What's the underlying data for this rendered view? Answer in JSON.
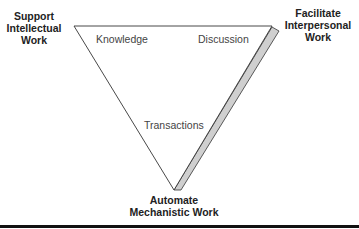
{
  "diagram": {
    "vertices": {
      "top_left": [
        "Support",
        "Intellectual",
        "Work"
      ],
      "top_right": [
        "Facilitate",
        "Interpersonal",
        "Work"
      ],
      "bottom": [
        "Automate",
        "Mechanistic Work"
      ]
    },
    "inner_labels": {
      "knowledge": "Knowledge",
      "discussion": "Discussion",
      "transactions": "Transactions"
    },
    "colors": {
      "edge": "#333333",
      "slab_fill": "#cfcfcf",
      "rule": "#111111"
    }
  }
}
